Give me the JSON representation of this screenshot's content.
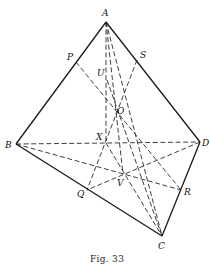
{
  "figure": {
    "caption": "Fig. 33",
    "points": {
      "A": {
        "label": "A",
        "x": 106,
        "y": 22,
        "lx": 102,
        "ly": 16
      },
      "B": {
        "label": "B",
        "x": 16,
        "y": 144,
        "lx": 5,
        "ly": 148
      },
      "C": {
        "label": "C",
        "x": 162,
        "y": 236,
        "lx": 158,
        "ly": 249
      },
      "D": {
        "label": "D",
        "x": 200,
        "y": 142,
        "lx": 202,
        "ly": 146
      },
      "P": {
        "label": "P",
        "x": 76,
        "y": 62,
        "lx": 67,
        "ly": 60
      },
      "S": {
        "label": "S",
        "x": 137,
        "y": 60,
        "lx": 140,
        "ly": 58
      },
      "Q": {
        "label": "Q",
        "x": 87,
        "y": 190,
        "lx": 77,
        "ly": 197
      },
      "R": {
        "label": "R",
        "x": 181,
        "y": 190,
        "lx": 184,
        "ly": 195
      },
      "U": {
        "label": "U",
        "x": 107,
        "y": 80,
        "lx": 97,
        "ly": 76
      },
      "O": {
        "label": "O",
        "x": 116,
        "y": 108,
        "lx": 117,
        "ly": 114
      },
      "X": {
        "label": "X",
        "x": 106,
        "y": 143,
        "lx": 96,
        "ly": 140
      },
      "V": {
        "label": "V",
        "x": 123,
        "y": 174,
        "lx": 117,
        "ly": 186
      }
    },
    "solid_edges": [
      [
        "A",
        "B"
      ],
      [
        "A",
        "D"
      ],
      [
        "B",
        "C"
      ],
      [
        "D",
        "C"
      ]
    ],
    "dashed_edges": [
      [
        "B",
        "D"
      ],
      [
        "P",
        "R"
      ],
      [
        "S",
        "Q"
      ],
      [
        "B",
        "R"
      ],
      [
        "D",
        "Q"
      ],
      [
        "A",
        "X"
      ],
      [
        "X",
        "C"
      ],
      [
        "A",
        "C"
      ],
      [
        "A",
        "V"
      ],
      [
        "U",
        "C"
      ]
    ]
  }
}
